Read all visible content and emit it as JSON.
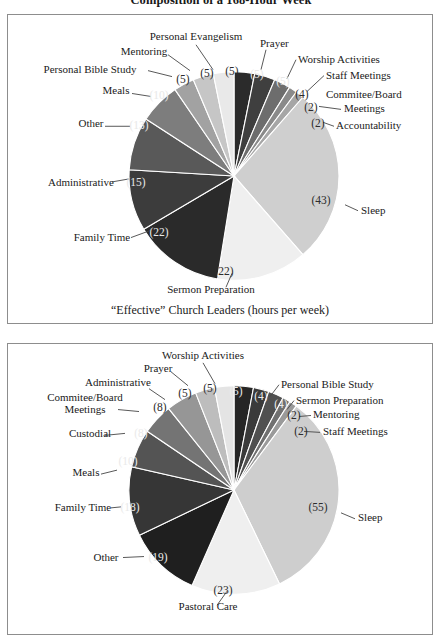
{
  "figure": {
    "title": "Composition of a 168-Hour Week"
  },
  "colors": {
    "panel_border": "#8d8d8d",
    "slice_stroke": "#ffffff",
    "text": "#1a1a1a",
    "leader_line": "#454545"
  },
  "panels": [
    {
      "id": "effective-leaders",
      "caption": "“Effective” Church Leaders (hours per week)",
      "chart_data": {
        "type": "pie",
        "title": "“Effective” Church Leaders (hours per week)",
        "total": 168,
        "units": "hours per week",
        "start_angle_deg": -90,
        "direction": "clockwise",
        "categories": [
          "Prayer",
          "Worship Activities",
          "Staff Meetings",
          "Commitee/Board Meetings",
          "Accountability",
          "Sleep",
          "Sermon Preparation",
          "Family Time",
          "Administrative",
          "Other",
          "Meals",
          "Personal Bible Study",
          "Mentoring",
          "Personal Evangelism"
        ],
        "values": [
          5,
          5,
          4,
          2,
          2,
          43,
          22,
          22,
          15,
          13,
          10,
          5,
          5,
          5
        ],
        "value_labels": [
          "(5)",
          "(5)",
          "(4)",
          "(2)",
          "(2)",
          "(43)",
          "(22)",
          "(22)",
          "(15)",
          "(13)",
          "(10)",
          "(5)",
          "(5)",
          "(5)"
        ],
        "slice_colors": [
          "#2b2b2b",
          "#3f3f3f",
          "#6d6d6d",
          "#8a8a8a",
          "#a6a6a6",
          "#cfcfcf",
          "#efefef",
          "#2a2a2a",
          "#3c3c3c",
          "#595959",
          "#7d7d7d",
          "#a2a2a2",
          "#c6c6c6",
          "#e9e9e9"
        ],
        "legend": "callout-labels"
      }
    },
    {
      "id": "typical-leaders",
      "caption": "",
      "chart_data": {
        "type": "pie",
        "title": "",
        "total": 168,
        "units": "hours per week",
        "start_angle_deg": -90,
        "direction": "clockwise",
        "categories": [
          "Worship Activities",
          "Personal Bible Study",
          "Sermon Preparation",
          "Mentoring",
          "Staff Meetings",
          "Sleep",
          "Pastoral Care",
          "Other",
          "Family Time",
          "Meals",
          "Custodial",
          "Commitee/Board Meetings",
          "Administrative",
          "Prayer"
        ],
        "values": [
          5,
          4,
          4,
          2,
          2,
          55,
          23,
          19,
          18,
          10,
          8,
          8,
          5,
          5
        ],
        "value_labels": [
          "(5)",
          "(4)",
          "(4)",
          "(2)",
          "(2)",
          "(55)",
          "(23)",
          "(19)",
          "(18)",
          "(10)",
          "(8)",
          "(8)",
          "(5)",
          "(5)"
        ],
        "slice_colors": [
          "#262626",
          "#3a3a3a",
          "#505050",
          "#707070",
          "#9a9a9a",
          "#cecece",
          "#efefef",
          "#1f1f1f",
          "#363636",
          "#545454",
          "#747474",
          "#969696",
          "#bdbdbd",
          "#e4e4e4"
        ],
        "legend": "callout-labels"
      }
    }
  ],
  "top_labels": [
    {
      "text": "Personal Evangelism",
      "x": 188,
      "y": 25,
      "anchor": "middle"
    },
    {
      "text": "Mentoring",
      "x": 136,
      "y": 40,
      "anchor": "middle"
    },
    {
      "text": "Personal Bible Study",
      "x": 82,
      "y": 58,
      "anchor": "middle"
    },
    {
      "text": "Meals",
      "x": 108,
      "y": 80,
      "anchor": "middle"
    },
    {
      "text": "Other",
      "x": 83,
      "y": 113,
      "anchor": "middle"
    },
    {
      "text": "Administrative",
      "x": 73,
      "y": 172,
      "anchor": "middle"
    },
    {
      "text": "Family Time",
      "x": 94,
      "y": 227,
      "anchor": "middle"
    },
    {
      "text": "Sermon Preparation",
      "x": 203,
      "y": 280,
      "anchor": "middle"
    },
    {
      "text": "Sleep",
      "x": 353,
      "y": 200,
      "anchor": "start"
    },
    {
      "text": "Accountability",
      "x": 328,
      "y": 115,
      "anchor": "start"
    },
    {
      "text": "Meetings",
      "x": 336,
      "y": 98,
      "anchor": "start"
    },
    {
      "text": "Commitee/Board",
      "x": 318,
      "y": 84,
      "anchor": "start"
    },
    {
      "text": "Staff Meetings",
      "x": 318,
      "y": 64,
      "anchor": "start"
    },
    {
      "text": "Worship Activities",
      "x": 290,
      "y": 48,
      "anchor": "start"
    },
    {
      "text": "Prayer",
      "x": 252,
      "y": 32,
      "anchor": "start"
    }
  ],
  "top_values": [
    {
      "text": "(5)",
      "x": 249,
      "y": 63,
      "fill": "#e8e8e8"
    },
    {
      "text": "(5)",
      "x": 275,
      "y": 70,
      "fill": "#e8e8e8"
    },
    {
      "text": "(4)",
      "x": 294,
      "y": 84,
      "fill": "#2c2c2c"
    },
    {
      "text": "(2)",
      "x": 303,
      "y": 97,
      "fill": "#2c2c2c"
    },
    {
      "text": "(2)",
      "x": 310,
      "y": 113,
      "fill": "#2c2c2c"
    },
    {
      "text": "(43)",
      "x": 313,
      "y": 190,
      "fill": "#2c2c2c"
    },
    {
      "text": "(22)",
      "x": 216,
      "y": 262,
      "fill": "#2c2c2c"
    },
    {
      "text": "(22)",
      "x": 151,
      "y": 222,
      "fill": "#e8e8e8"
    },
    {
      "text": "(15)",
      "x": 128,
      "y": 172,
      "fill": "#e8e8e8"
    },
    {
      "text": "(13)",
      "x": 131,
      "y": 115,
      "fill": "#e8e8e8"
    },
    {
      "text": "(10)",
      "x": 151,
      "y": 85,
      "fill": "#e8e8e8"
    },
    {
      "text": "(5)",
      "x": 175,
      "y": 68,
      "fill": "#2c2c2c"
    },
    {
      "text": "(5)",
      "x": 199,
      "y": 62,
      "fill": "#2c2c2c"
    },
    {
      "text": "(5)",
      "x": 224,
      "y": 60,
      "fill": "#2c2c2c"
    }
  ],
  "bottom_labels": [
    {
      "text": "Worship Activities",
      "x": 195,
      "y": 15,
      "anchor": "middle"
    },
    {
      "text": "Prayer",
      "x": 150,
      "y": 28,
      "anchor": "middle"
    },
    {
      "text": "Administrative",
      "x": 110,
      "y": 42,
      "anchor": "middle"
    },
    {
      "text": "Commitee/Board",
      "x": 77,
      "y": 57,
      "anchor": "middle"
    },
    {
      "text": "Meetings",
      "x": 77,
      "y": 69,
      "anchor": "middle"
    },
    {
      "text": "Custodial",
      "x": 82,
      "y": 94,
      "anchor": "middle"
    },
    {
      "text": "Meals",
      "x": 78,
      "y": 133,
      "anchor": "middle"
    },
    {
      "text": "Family Time",
      "x": 75,
      "y": 168,
      "anchor": "middle"
    },
    {
      "text": "Other",
      "x": 98,
      "y": 218,
      "anchor": "middle"
    },
    {
      "text": "Pastoral Care",
      "x": 200,
      "y": 268,
      "anchor": "middle"
    },
    {
      "text": "Sleep",
      "x": 350,
      "y": 178,
      "anchor": "start"
    },
    {
      "text": "Staff Meetings",
      "x": 315,
      "y": 92,
      "anchor": "start"
    },
    {
      "text": "Mentoring",
      "x": 305,
      "y": 75,
      "anchor": "start"
    },
    {
      "text": "Sermon Preparation",
      "x": 288,
      "y": 60,
      "anchor": "start"
    },
    {
      "text": "Personal Bible Study",
      "x": 273,
      "y": 44,
      "anchor": "start"
    }
  ],
  "bottom_values": [
    {
      "text": "(5)",
      "x": 228,
      "y": 51,
      "fill": "#eaeaea"
    },
    {
      "text": "(4)",
      "x": 253,
      "y": 56,
      "fill": "#eaeaea"
    },
    {
      "text": "(4)",
      "x": 273,
      "y": 64,
      "fill": "#eaeaea"
    },
    {
      "text": "(2)",
      "x": 286,
      "y": 76,
      "fill": "#2c2c2c"
    },
    {
      "text": "(2)",
      "x": 293,
      "y": 92,
      "fill": "#2c2c2c"
    },
    {
      "text": "(55)",
      "x": 310,
      "y": 168,
      "fill": "#2c2c2c"
    },
    {
      "text": "(23)",
      "x": 215,
      "y": 252,
      "fill": "#2c2c2c"
    },
    {
      "text": "(19)",
      "x": 150,
      "y": 219,
      "fill": "#eaeaea"
    },
    {
      "text": "(18)",
      "x": 122,
      "y": 168,
      "fill": "#eaeaea"
    },
    {
      "text": "(10)",
      "x": 120,
      "y": 122,
      "fill": "#eaeaea"
    },
    {
      "text": "(8)",
      "x": 133,
      "y": 94,
      "fill": "#eaeaea"
    },
    {
      "text": "(8)",
      "x": 152,
      "y": 67,
      "fill": "#2c2c2c"
    },
    {
      "text": "(5)",
      "x": 177,
      "y": 53,
      "fill": "#2c2c2c"
    },
    {
      "text": "(5)",
      "x": 202,
      "y": 48,
      "fill": "#2c2c2c"
    }
  ],
  "top_leaders": [
    {
      "x1": 188,
      "y1": 30,
      "x2": 205,
      "y2": 55
    },
    {
      "x1": 160,
      "y1": 40,
      "x2": 182,
      "y2": 56
    },
    {
      "x1": 140,
      "y1": 56,
      "x2": 164,
      "y2": 62
    },
    {
      "x1": 124,
      "y1": 79,
      "x2": 143,
      "y2": 82
    },
    {
      "x1": 97,
      "y1": 112,
      "x2": 122,
      "y2": 112
    },
    {
      "x1": 104,
      "y1": 168,
      "x2": 121,
      "y2": 165
    },
    {
      "x1": 123,
      "y1": 224,
      "x2": 142,
      "y2": 217
    },
    {
      "x1": 218,
      "y1": 274,
      "x2": 224,
      "y2": 260
    },
    {
      "x1": 350,
      "y1": 197,
      "x2": 337,
      "y2": 191
    },
    {
      "x1": 326,
      "y1": 112,
      "x2": 315,
      "y2": 108
    },
    {
      "x1": 333,
      "y1": 95,
      "x2": 311,
      "y2": 92
    },
    {
      "x1": 316,
      "y1": 61,
      "x2": 299,
      "y2": 77
    },
    {
      "x1": 288,
      "y1": 45,
      "x2": 279,
      "y2": 64
    },
    {
      "x1": 258,
      "y1": 35,
      "x2": 253,
      "y2": 55
    }
  ],
  "bottom_leaders": [
    {
      "x1": 195,
      "y1": 19,
      "x2": 207,
      "y2": 40
    },
    {
      "x1": 163,
      "y1": 28,
      "x2": 180,
      "y2": 42
    },
    {
      "x1": 141,
      "y1": 45,
      "x2": 157,
      "y2": 56
    },
    {
      "x1": 110,
      "y1": 66,
      "x2": 131,
      "y2": 68
    },
    {
      "x1": 97,
      "y1": 92,
      "x2": 117,
      "y2": 90
    },
    {
      "x1": 93,
      "y1": 131,
      "x2": 109,
      "y2": 127
    },
    {
      "x1": 103,
      "y1": 165,
      "x2": 113,
      "y2": 164
    },
    {
      "x1": 115,
      "y1": 215,
      "x2": 136,
      "y2": 214
    },
    {
      "x1": 209,
      "y1": 263,
      "x2": 219,
      "y2": 249
    },
    {
      "x1": 347,
      "y1": 176,
      "x2": 333,
      "y2": 170
    },
    {
      "x1": 312,
      "y1": 89,
      "x2": 296,
      "y2": 88
    },
    {
      "x1": 303,
      "y1": 72,
      "x2": 291,
      "y2": 73
    },
    {
      "x1": 286,
      "y1": 57,
      "x2": 279,
      "y2": 66
    },
    {
      "x1": 271,
      "y1": 41,
      "x2": 262,
      "y2": 53
    }
  ]
}
